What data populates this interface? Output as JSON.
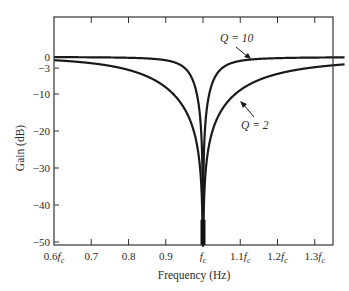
{
  "chart_data": {
    "type": "line",
    "title": "",
    "xlabel": "Frequency (Hz)",
    "ylabel": "Gain (dB)",
    "xlim": [
      0.6,
      1.38
    ],
    "ylim": [
      -51,
      0
    ],
    "grid": false,
    "legend": "none (inline annotations)",
    "x_ticks": [
      {
        "value": 0.6,
        "label": "0.6",
        "suffix": "f",
        "sub": "c"
      },
      {
        "value": 0.7,
        "label": "0.7",
        "suffix": "",
        "sub": ""
      },
      {
        "value": 0.8,
        "label": "0.8",
        "suffix": "",
        "sub": ""
      },
      {
        "value": 0.9,
        "label": "0.9",
        "suffix": "",
        "sub": ""
      },
      {
        "value": 1.0,
        "label": "",
        "suffix": "f",
        "sub": "c"
      },
      {
        "value": 1.1,
        "label": "1.1",
        "suffix": "f",
        "sub": "c"
      },
      {
        "value": 1.2,
        "label": "1.2",
        "suffix": "f",
        "sub": "c"
      },
      {
        "value": 1.3,
        "label": "1.3",
        "suffix": "f",
        "sub": "c"
      }
    ],
    "y_ticks": [
      {
        "value": 0,
        "label": "0"
      },
      {
        "value": -3,
        "label": "−3"
      },
      {
        "value": -10,
        "label": "−10"
      },
      {
        "value": -20,
        "label": "−20"
      },
      {
        "value": -30,
        "label": "−30"
      },
      {
        "value": -40,
        "label": "−40"
      },
      {
        "value": -50,
        "label": "−50"
      }
    ],
    "series": [
      {
        "name": "Q = 10",
        "Q": 10,
        "annotation": "Q = 10",
        "x": [
          0.6,
          0.7,
          0.8,
          0.85,
          0.9,
          0.93,
          0.95,
          0.97,
          0.98,
          0.99,
          0.995,
          1.0,
          1.005,
          1.01,
          1.02,
          1.03,
          1.05,
          1.1,
          1.2,
          1.3,
          1.38
        ],
        "y": [
          -0.04,
          -0.08,
          -0.21,
          -0.41,
          -0.88,
          -1.68,
          -2.9,
          -5.68,
          -8.53,
          -14.1,
          -20.0,
          -51,
          -20.0,
          -14.0,
          -8.4,
          -5.6,
          -2.8,
          -0.86,
          -0.27,
          -0.13,
          -0.09
        ]
      },
      {
        "name": "Q = 2",
        "Q": 2,
        "annotation": "Q = 2",
        "x": [
          0.6,
          0.7,
          0.8,
          0.85,
          0.9,
          0.93,
          0.95,
          0.97,
          0.98,
          0.99,
          1.0,
          1.01,
          1.02,
          1.03,
          1.05,
          1.1,
          1.2,
          1.3,
          1.38
        ],
        "y": [
          -0.86,
          -1.84,
          -4.1,
          -6.1,
          -9.6,
          -13.5,
          -17.4,
          -24.6,
          -28.2,
          -34.1,
          -51,
          -34.0,
          -28.0,
          -24.5,
          -17.1,
          -9.2,
          -4.0,
          -2.5,
          -2.0
        ]
      }
    ],
    "model": "notch filter: G = |1-(f/fc)^2| / sqrt((1-(f/fc)^2)^2 + ((f/fc)/Q)^2)"
  }
}
